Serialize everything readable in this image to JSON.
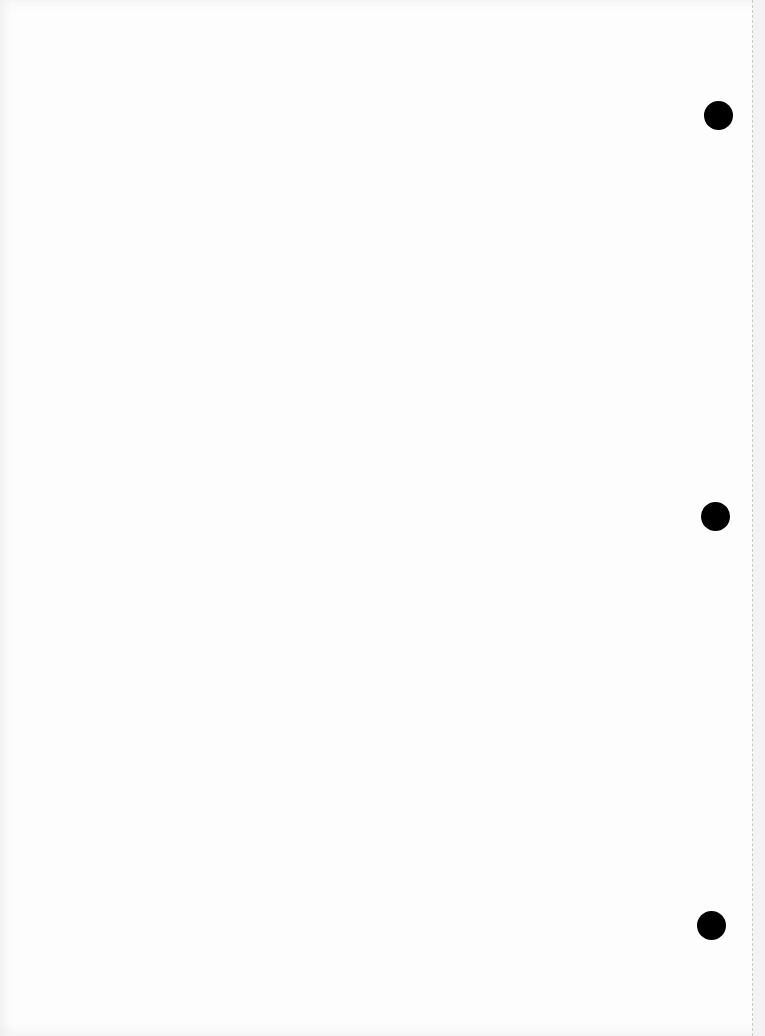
{
  "document": {
    "type": "blank scanned page",
    "paper_color": "#fdfdfd",
    "hole_color": "#000000",
    "holes": [
      {
        "name": "punch-hole-top",
        "x": 704,
        "y": 101,
        "d": 29
      },
      {
        "name": "punch-hole-middle",
        "x": 701,
        "y": 502,
        "d": 29
      },
      {
        "name": "punch-hole-bottom",
        "x": 697,
        "y": 911,
        "d": 29
      }
    ],
    "perforation_x": 752,
    "bleed_through_text": [
      "",
      "",
      "",
      ""
    ]
  }
}
